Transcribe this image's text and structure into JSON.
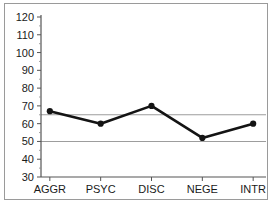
{
  "chart_data": {
    "type": "line",
    "title": "",
    "subtitle": "",
    "xlabel": "",
    "ylabel": "",
    "categories": [
      "AGGR",
      "PSYC",
      "DISC",
      "NEGE",
      "INTR"
    ],
    "values": [
      67,
      60,
      70,
      52,
      60
    ],
    "series": [
      {
        "name": "profile",
        "values": [
          67,
          60,
          70,
          52,
          60
        ],
        "color": "#141414",
        "marker": "circle"
      }
    ],
    "ylim": [
      30,
      120
    ],
    "ytick_values": [
      30,
      40,
      50,
      60,
      70,
      80,
      90,
      100,
      110,
      120
    ],
    "ytick_labels": [
      "30",
      "40",
      "50",
      "60",
      "70",
      "80",
      "90",
      "100",
      "110",
      "120"
    ],
    "xtick_labels": [
      "AGGR",
      "PSYC",
      "DISC",
      "NEGE",
      "INTR"
    ],
    "reference_lines": [
      {
        "value": 65,
        "orientation": "horizontal",
        "color": "#9d9d9d"
      },
      {
        "value": 50,
        "orientation": "horizontal",
        "color": "#9d9d9d"
      }
    ],
    "grid": false,
    "legend": null,
    "legend_position": "none",
    "annotations": [],
    "background_color": "#ffffff",
    "frame_color": "#9a9a9a",
    "axis_color": "#555555"
  }
}
